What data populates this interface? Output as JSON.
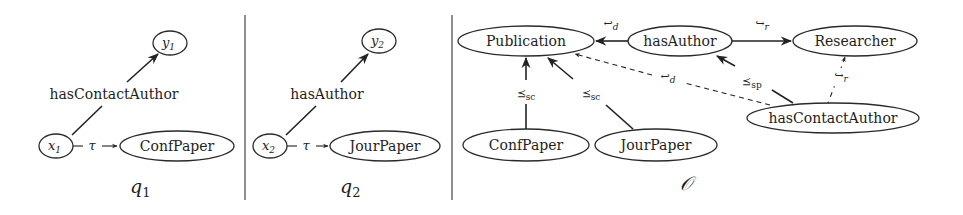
{
  "panels": [
    {
      "id": "q1",
      "title": "q",
      "title_sub": "1",
      "nodes": {
        "y": {
          "name": "y",
          "sub": "1"
        },
        "x": {
          "name": "x",
          "sub": "1"
        },
        "class": {
          "label": "ConfPaper"
        }
      },
      "edge_labels": {
        "property": "hasContactAuthor",
        "type": "τ"
      }
    },
    {
      "id": "q2",
      "title": "q",
      "title_sub": "2",
      "nodes": {
        "y": {
          "name": "y",
          "sub": "2"
        },
        "x": {
          "name": "x",
          "sub": "2"
        },
        "class": {
          "label": "JourPaper"
        }
      },
      "edge_labels": {
        "property": "hasAuthor",
        "type": "τ"
      }
    }
  ],
  "ontology": {
    "title": "𝒪",
    "nodes": {
      "publication": "Publication",
      "hasAuthor": "hasAuthor",
      "researcher": "Researcher",
      "hasContactAuthor": "hasContactAuthor",
      "confPaper": "ConfPaper",
      "jourPaper": "JourPaper"
    },
    "edge_labels": {
      "domain_symbol": "↩",
      "domain_sub": "d",
      "range_symbol": "↪",
      "range_sub": "r",
      "subclass_symbol": "⪯",
      "subclass_sub": "sc",
      "subproperty_symbol": "⪯",
      "subproperty_sub": "sp"
    }
  }
}
